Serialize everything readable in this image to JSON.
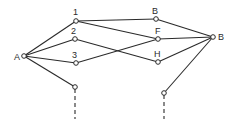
{
  "diagram": {
    "type": "network-graph",
    "nodes": [
      {
        "id": "A",
        "label": "A",
        "x": 24,
        "y": 56,
        "lx": 14,
        "ly": 60
      },
      {
        "id": "n1",
        "label": "1",
        "x": 76,
        "y": 21,
        "lx": 73,
        "ly": 15
      },
      {
        "id": "n2",
        "label": "2",
        "x": 75,
        "y": 39,
        "lx": 71,
        "ly": 34
      },
      {
        "id": "n3",
        "label": "3",
        "x": 76,
        "y": 63,
        "lx": 72,
        "ly": 58
      },
      {
        "id": "nL",
        "label": "",
        "x": 75,
        "y": 87,
        "lx": 0,
        "ly": 0
      },
      {
        "id": "Btop",
        "label": "B",
        "x": 156,
        "y": 19,
        "lx": 152,
        "ly": 14
      },
      {
        "id": "F",
        "label": "F",
        "x": 158,
        "y": 39,
        "lx": 155,
        "ly": 34
      },
      {
        "id": "H",
        "label": "H",
        "x": 158,
        "y": 62,
        "lx": 154,
        "ly": 57
      },
      {
        "id": "nR",
        "label": "",
        "x": 164,
        "y": 93,
        "lx": 0,
        "ly": 0
      },
      {
        "id": "Bright",
        "label": "B",
        "x": 213,
        "y": 37,
        "lx": 218,
        "ly": 40
      }
    ],
    "edges": [
      {
        "from": "A",
        "to": "n1"
      },
      {
        "from": "A",
        "to": "n2"
      },
      {
        "from": "A",
        "to": "n3"
      },
      {
        "from": "A",
        "to": "nL"
      },
      {
        "from": "n1",
        "to": "Btop"
      },
      {
        "from": "n1",
        "to": "F"
      },
      {
        "from": "n2",
        "to": "H"
      },
      {
        "from": "n3",
        "to": "F"
      },
      {
        "from": "Btop",
        "to": "Bright"
      },
      {
        "from": "F",
        "to": "Bright"
      },
      {
        "from": "H",
        "to": "Bright"
      },
      {
        "from": "nR",
        "to": "Bright"
      }
    ],
    "dashed_edges": [
      {
        "from": "nL",
        "x2": 75,
        "y2": 119
      },
      {
        "from": "nR",
        "x2": 164,
        "y2": 119
      }
    ]
  }
}
